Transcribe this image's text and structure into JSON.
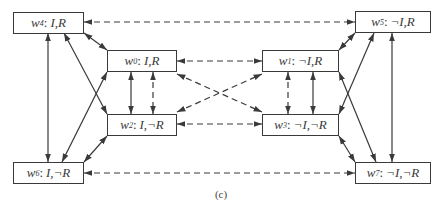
{
  "diagram": {
    "caption": "(c)",
    "colors": {
      "stroke": "#3a3a3a",
      "background": "#ffffff"
    },
    "nodes": [
      {
        "id": "w4",
        "name": "w",
        "sub": "4",
        "label": "I,R",
        "box": [
          13,
          12,
          71,
          22
        ]
      },
      {
        "id": "w5",
        "name": "w",
        "sub": "5",
        "label": "¬I,R",
        "box": [
          355,
          11,
          76,
          22
        ]
      },
      {
        "id": "w0",
        "name": "w",
        "sub": "0",
        "label": "I,R",
        "box": [
          107,
          50,
          70,
          22
        ]
      },
      {
        "id": "w1",
        "name": "w",
        "sub": "1",
        "label": "¬I,R",
        "box": [
          262,
          50,
          77,
          22
        ]
      },
      {
        "id": "w2",
        "name": "w",
        "sub": "2",
        "label": "I,¬R",
        "box": [
          107,
          114,
          70,
          22
        ]
      },
      {
        "id": "w3",
        "name": "w",
        "sub": "3",
        "label": "¬I,¬R",
        "box": [
          262,
          114,
          77,
          22
        ]
      },
      {
        "id": "w6",
        "name": "w",
        "sub": "6",
        "label": "I,¬R",
        "box": [
          13,
          162,
          71,
          22
        ]
      },
      {
        "id": "w7",
        "name": "w",
        "sub": "7",
        "label": "¬I,¬R",
        "box": [
          355,
          162,
          76,
          22
        ]
      }
    ],
    "edges": [
      {
        "from": "w4",
        "to": "w5",
        "style": "dashed",
        "heads": "both",
        "pts": [
          84,
          22,
          355,
          22
        ]
      },
      {
        "from": "w0",
        "to": "w1",
        "style": "dashed",
        "heads": "both",
        "pts": [
          177,
          61,
          262,
          61
        ]
      },
      {
        "from": "w2",
        "to": "w3",
        "style": "dashed",
        "heads": "both",
        "pts": [
          177,
          124,
          262,
          124
        ]
      },
      {
        "from": "w6",
        "to": "w7",
        "style": "dashed",
        "heads": "both",
        "pts": [
          84,
          173,
          355,
          173
        ]
      },
      {
        "from": "w0",
        "to": "w3",
        "style": "dashed",
        "heads": "both",
        "pts": [
          177,
          74,
          262,
          112
        ]
      },
      {
        "from": "w2",
        "to": "w1",
        "style": "dashed",
        "heads": "both",
        "pts": [
          177,
          112,
          262,
          74
        ]
      },
      {
        "from": "w0",
        "to": "w2",
        "style": "solid",
        "heads": "both",
        "pts": [
          131,
          72,
          131,
          114
        ]
      },
      {
        "from": "w0",
        "to": "w2",
        "style": "dashed",
        "heads": "both",
        "pts": [
          153,
          72,
          153,
          114
        ]
      },
      {
        "from": "w1",
        "to": "w3",
        "style": "dashed",
        "heads": "both",
        "pts": [
          288,
          72,
          288,
          114
        ]
      },
      {
        "from": "w1",
        "to": "w3",
        "style": "solid",
        "heads": "both",
        "pts": [
          313,
          72,
          313,
          114
        ]
      },
      {
        "from": "w4",
        "to": "w0",
        "style": "solid",
        "heads": "both",
        "pts": [
          84,
          33,
          107,
          50
        ]
      },
      {
        "from": "w2",
        "to": "w6",
        "style": "solid",
        "heads": "both",
        "pts": [
          107,
          136,
          84,
          162
        ]
      },
      {
        "from": "w4",
        "to": "w6",
        "style": "solid",
        "heads": "both",
        "pts": [
          48,
          33,
          48,
          162
        ]
      },
      {
        "from": "w4",
        "to": "w2",
        "style": "solid",
        "heads": "both",
        "pts": [
          64,
          33,
          107,
          114
        ]
      },
      {
        "from": "w6",
        "to": "w0",
        "style": "solid",
        "heads": "both",
        "pts": [
          62,
          162,
          107,
          72
        ]
      },
      {
        "from": "w5",
        "to": "w1",
        "style": "solid",
        "heads": "both",
        "pts": [
          355,
          33,
          339,
          50
        ]
      },
      {
        "from": "w3",
        "to": "w7",
        "style": "solid",
        "heads": "both",
        "pts": [
          339,
          136,
          355,
          162
        ]
      },
      {
        "from": "w5",
        "to": "w7",
        "style": "solid",
        "heads": "both",
        "pts": [
          392,
          33,
          392,
          162
        ]
      },
      {
        "from": "w5",
        "to": "w3",
        "style": "solid",
        "heads": "both",
        "pts": [
          374,
          33,
          339,
          114
        ]
      },
      {
        "from": "w1",
        "to": "w7",
        "style": "solid",
        "heads": "both",
        "pts": [
          339,
          72,
          376,
          162
        ]
      }
    ]
  }
}
